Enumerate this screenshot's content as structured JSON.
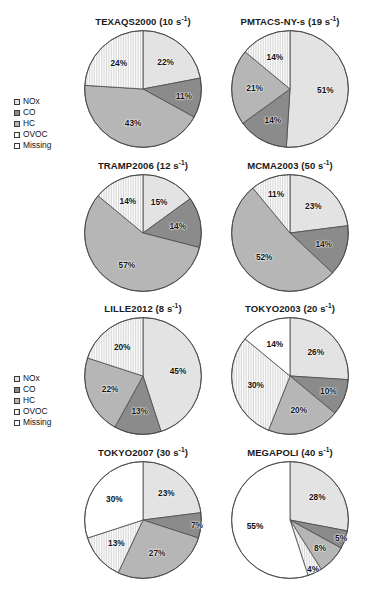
{
  "figure": {
    "categories": [
      "NOx",
      "CO",
      "HC",
      "OVOC",
      "Missing"
    ],
    "colors": {
      "NOx": "#e3e3e3",
      "CO": "#8b8b8b",
      "HC": "#b6b6b6",
      "OVOC": "#ffffff",
      "Missing": "#ffffff"
    }
  },
  "legend": {
    "items": [
      {
        "label": "NOx",
        "swatch": "#e3e3e3"
      },
      {
        "label": "CO",
        "swatch": "#8b8b8b"
      },
      {
        "label": "HC",
        "swatch": "#b6b6b6"
      },
      {
        "label": "OVOC",
        "swatch": "#ffffff"
      },
      {
        "label": "Missing",
        "swatch": "#ffffff"
      }
    ]
  },
  "chart_data": [
    {
      "type": "pie",
      "title": "TEXAQS2000 (10 s-1)",
      "title_name": "TEXAQS2000",
      "title_rate": "10",
      "title_unit": "s",
      "title_exp": "-1",
      "categories": [
        "NOx",
        "CO",
        "HC",
        "OVOC",
        "Missing"
      ],
      "values": [
        22,
        11,
        43,
        24,
        0
      ],
      "labels": [
        "22%",
        "11%",
        "43%",
        "24%",
        ""
      ],
      "legend_position": "left-external"
    },
    {
      "type": "pie",
      "title": "PMTACS-NY-s (19 s-1)",
      "title_name": "PMTACS-NY-s",
      "title_rate": "19",
      "title_unit": "s",
      "title_exp": "-1",
      "categories": [
        "NOx",
        "CO",
        "HC",
        "OVOC",
        "Missing"
      ],
      "values": [
        51,
        14,
        21,
        14,
        0
      ],
      "labels": [
        "51%",
        "14%",
        "21%",
        "14%",
        ""
      ],
      "legend_position": "left-external"
    },
    {
      "type": "pie",
      "title": "TRAMP2006 (12 s-1)",
      "title_name": "TRAMP2006",
      "title_rate": "12",
      "title_unit": "s",
      "title_exp": "-1",
      "categories": [
        "NOx",
        "CO",
        "HC",
        "OVOC",
        "Missing"
      ],
      "values": [
        15,
        14,
        57,
        14,
        0
      ],
      "labels": [
        "15%",
        "14%",
        "57%",
        "14%",
        ""
      ],
      "legend_position": "left-external"
    },
    {
      "type": "pie",
      "title": "MCMA2003 (50 s-1)",
      "title_name": "MCMA2003",
      "title_rate": "50",
      "title_unit": "s",
      "title_exp": "-1",
      "categories": [
        "NOx",
        "CO",
        "HC",
        "OVOC",
        "Missing"
      ],
      "values": [
        23,
        14,
        52,
        11,
        0
      ],
      "labels": [
        "23%",
        "14%",
        "52%",
        "11%",
        ""
      ],
      "legend_position": "left-external"
    },
    {
      "type": "pie",
      "title": "LILLE2012 (8 s-1)",
      "title_name": "LILLE2012",
      "title_rate": "8",
      "title_unit": "s",
      "title_exp": "-1",
      "categories": [
        "NOx",
        "CO",
        "HC",
        "OVOC",
        "Missing"
      ],
      "values": [
        45,
        13,
        22,
        20,
        0
      ],
      "labels": [
        "45%",
        "13%",
        "22%",
        "20%",
        ""
      ],
      "legend_position": "left-external"
    },
    {
      "type": "pie",
      "title": "TOKYO2003 (20 s-1)",
      "title_name": "TOKYO2003",
      "title_rate": "20",
      "title_unit": "s",
      "title_exp": "-1",
      "categories": [
        "NOx",
        "CO",
        "HC",
        "OVOC",
        "Missing"
      ],
      "values": [
        26,
        10,
        20,
        30,
        14
      ],
      "labels": [
        "26%",
        "10%",
        "20%",
        "30%",
        "14%"
      ],
      "legend_position": "left-external"
    },
    {
      "type": "pie",
      "title": "TOKYO2007 (30 s-1)",
      "title_name": "TOKYO2007",
      "title_rate": "30",
      "title_unit": "s",
      "title_exp": "-1",
      "categories": [
        "NOx",
        "CO",
        "HC",
        "OVOC",
        "Missing"
      ],
      "values": [
        23,
        7,
        27,
        13,
        30
      ],
      "labels": [
        "23%",
        "7%",
        "27%",
        "13%",
        "30%"
      ],
      "legend_position": "left-external"
    },
    {
      "type": "pie",
      "title": "MEGAPOLI (40 s-1)",
      "title_name": "MEGAPOLI",
      "title_rate": "40",
      "title_unit": "s",
      "title_exp": "-1",
      "categories": [
        "NOx",
        "CO",
        "HC",
        "OVOC",
        "Missing"
      ],
      "values": [
        28,
        5,
        8,
        4,
        55
      ],
      "labels": [
        "28%",
        "5%",
        "8%",
        "4%",
        "55%"
      ],
      "legend_position": "left-external"
    }
  ]
}
